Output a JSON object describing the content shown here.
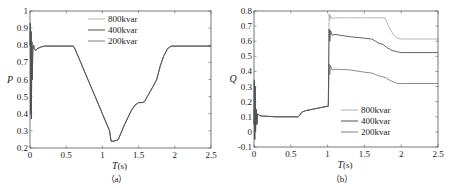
{
  "chart_data": [
    {
      "id": "a",
      "type": "line",
      "caption": "（a）",
      "title": "",
      "xlabel": "T",
      "xunit": "(s)",
      "ylabel": "P",
      "xlim": [
        0,
        2.5
      ],
      "ylim": [
        0.2,
        1.0
      ],
      "xticks": [
        0,
        0.5,
        1,
        1.5,
        2,
        2.5
      ],
      "xtick_labels": [
        "0",
        "0.5",
        "1",
        "1.5",
        "2",
        "2.5"
      ],
      "yticks": [
        0.2,
        0.3,
        0.4,
        0.5,
        0.6,
        0.7,
        0.8,
        0.9,
        1.0
      ],
      "ytick_labels": [
        "0.2",
        "0.3",
        "0.4",
        "0.5",
        "0.6",
        "0.7",
        "0.8",
        "0.9",
        "1"
      ],
      "grid": false,
      "legend_position": "top-center",
      "series": [
        {
          "name": "800kvar",
          "color": "#b0b0b0",
          "x": [
            0,
            0.005,
            0.01,
            0.015,
            0.02,
            0.025,
            0.03,
            0.04,
            0.05,
            0.06,
            0.08,
            0.1,
            0.15,
            0.2,
            0.25,
            0.3,
            0.6,
            0.62,
            0.7,
            0.8,
            0.9,
            1.0,
            1.1,
            1.12,
            1.15,
            1.2,
            1.22,
            1.3,
            1.4,
            1.45,
            1.5,
            1.55,
            1.58,
            1.62,
            1.7,
            1.75,
            1.8,
            1.85,
            1.9,
            1.95,
            2.0,
            2.5
          ],
          "y": [
            0.8,
            0.93,
            0.4,
            0.88,
            0.37,
            0.82,
            0.6,
            0.79,
            0.8,
            0.78,
            0.77,
            0.78,
            0.79,
            0.795,
            0.795,
            0.795,
            0.795,
            0.78,
            0.7,
            0.6,
            0.5,
            0.4,
            0.3,
            0.24,
            0.24,
            0.245,
            0.25,
            0.33,
            0.42,
            0.45,
            0.465,
            0.465,
            0.47,
            0.5,
            0.56,
            0.6,
            0.68,
            0.74,
            0.78,
            0.795,
            0.795,
            0.795
          ]
        },
        {
          "name": "400kvar",
          "color": "#505050",
          "x": [
            0,
            0.005,
            0.01,
            0.015,
            0.02,
            0.025,
            0.03,
            0.04,
            0.05,
            0.06,
            0.08,
            0.1,
            0.15,
            0.2,
            0.25,
            0.3,
            0.6,
            0.62,
            0.7,
            0.8,
            0.9,
            1.0,
            1.1,
            1.12,
            1.15,
            1.2,
            1.22,
            1.3,
            1.4,
            1.45,
            1.5,
            1.55,
            1.58,
            1.62,
            1.7,
            1.75,
            1.8,
            1.85,
            1.9,
            1.95,
            2.0,
            2.5
          ],
          "y": [
            0.8,
            0.93,
            0.4,
            0.88,
            0.37,
            0.82,
            0.6,
            0.79,
            0.8,
            0.78,
            0.77,
            0.78,
            0.79,
            0.795,
            0.795,
            0.795,
            0.795,
            0.78,
            0.7,
            0.6,
            0.5,
            0.4,
            0.3,
            0.24,
            0.24,
            0.245,
            0.25,
            0.33,
            0.42,
            0.45,
            0.465,
            0.465,
            0.47,
            0.5,
            0.56,
            0.6,
            0.68,
            0.74,
            0.78,
            0.795,
            0.795,
            0.795
          ]
        },
        {
          "name": "200kvar",
          "color": "#808080",
          "x": [
            0,
            0.005,
            0.01,
            0.015,
            0.02,
            0.025,
            0.03,
            0.04,
            0.05,
            0.06,
            0.08,
            0.1,
            0.15,
            0.2,
            0.25,
            0.3,
            0.6,
            0.62,
            0.7,
            0.8,
            0.9,
            1.0,
            1.1,
            1.12,
            1.15,
            1.2,
            1.22,
            1.3,
            1.4,
            1.45,
            1.5,
            1.55,
            1.58,
            1.62,
            1.7,
            1.75,
            1.8,
            1.85,
            1.9,
            1.95,
            2.0,
            2.5
          ],
          "y": [
            0.8,
            0.93,
            0.4,
            0.88,
            0.37,
            0.82,
            0.6,
            0.79,
            0.8,
            0.78,
            0.77,
            0.78,
            0.79,
            0.795,
            0.795,
            0.795,
            0.795,
            0.78,
            0.7,
            0.6,
            0.5,
            0.4,
            0.3,
            0.24,
            0.24,
            0.245,
            0.25,
            0.33,
            0.42,
            0.45,
            0.465,
            0.465,
            0.47,
            0.5,
            0.56,
            0.6,
            0.68,
            0.74,
            0.78,
            0.795,
            0.795,
            0.795
          ]
        }
      ]
    },
    {
      "id": "b",
      "type": "line",
      "caption": "（b）",
      "title": "",
      "xlabel": "T",
      "xunit": "(s)",
      "ylabel": "Q",
      "xlim": [
        0,
        2.5
      ],
      "ylim": [
        -0.1,
        0.8
      ],
      "xticks": [
        0,
        0.5,
        1,
        1.5,
        2,
        2.5
      ],
      "xtick_labels": [
        "0",
        "0.5",
        "1",
        "1.5",
        "2",
        "2.5"
      ],
      "yticks": [
        -0.1,
        0,
        0.1,
        0.2,
        0.3,
        0.4,
        0.5,
        0.6,
        0.7,
        0.8
      ],
      "ytick_labels": [
        "-0.1",
        "0",
        "0.1",
        "0.2",
        "0.3",
        "0.4",
        "0.5",
        "0.6",
        "0.7",
        "0.8"
      ],
      "grid": false,
      "legend_position": "bottom-right",
      "series": [
        {
          "name": "800kvar",
          "color": "#b0b0b0",
          "x": [
            0,
            0.005,
            0.01,
            0.015,
            0.02,
            0.03,
            0.04,
            0.05,
            0.07,
            0.1,
            0.3,
            0.6,
            0.62,
            0.65,
            0.7,
            0.8,
            0.9,
            1.0,
            1.01,
            1.02,
            1.03,
            1.04,
            1.06,
            1.1,
            1.3,
            1.5,
            1.7,
            1.78,
            1.8,
            1.85,
            1.9,
            1.95,
            2.0,
            2.5
          ],
          "y": [
            0.05,
            0.34,
            -0.05,
            0.3,
            0.0,
            0.15,
            0.05,
            0.12,
            0.11,
            0.105,
            0.1,
            0.1,
            0.11,
            0.13,
            0.14,
            0.15,
            0.16,
            0.17,
            0.17,
            0.78,
            0.74,
            0.77,
            0.75,
            0.755,
            0.755,
            0.755,
            0.755,
            0.755,
            0.73,
            0.68,
            0.64,
            0.62,
            0.615,
            0.615
          ]
        },
        {
          "name": "400kvar",
          "color": "#505050",
          "x": [
            0,
            0.005,
            0.01,
            0.015,
            0.02,
            0.03,
            0.04,
            0.05,
            0.07,
            0.1,
            0.3,
            0.6,
            0.62,
            0.65,
            0.7,
            0.8,
            0.9,
            1.0,
            1.01,
            1.02,
            1.03,
            1.04,
            1.06,
            1.1,
            1.3,
            1.5,
            1.6,
            1.65,
            1.7,
            1.75,
            1.8,
            1.85,
            1.9,
            1.95,
            2.0,
            2.5
          ],
          "y": [
            0.05,
            0.34,
            -0.05,
            0.3,
            0.0,
            0.15,
            0.05,
            0.12,
            0.11,
            0.105,
            0.1,
            0.1,
            0.11,
            0.13,
            0.14,
            0.15,
            0.16,
            0.17,
            0.17,
            0.68,
            0.6,
            0.67,
            0.64,
            0.645,
            0.63,
            0.62,
            0.615,
            0.6,
            0.585,
            0.58,
            0.56,
            0.545,
            0.535,
            0.53,
            0.525,
            0.525
          ]
        },
        {
          "name": "200kvar",
          "color": "#808080",
          "x": [
            0,
            0.005,
            0.01,
            0.015,
            0.02,
            0.03,
            0.04,
            0.05,
            0.07,
            0.1,
            0.3,
            0.6,
            0.62,
            0.65,
            0.7,
            0.8,
            0.9,
            1.0,
            1.01,
            1.02,
            1.03,
            1.04,
            1.06,
            1.1,
            1.3,
            1.5,
            1.6,
            1.65,
            1.7,
            1.75,
            1.8,
            1.85,
            1.9,
            1.95,
            2.0,
            2.5
          ],
          "y": [
            0.05,
            0.34,
            -0.05,
            0.3,
            0.0,
            0.15,
            0.05,
            0.12,
            0.11,
            0.105,
            0.1,
            0.1,
            0.11,
            0.13,
            0.14,
            0.15,
            0.16,
            0.17,
            0.17,
            0.45,
            0.38,
            0.44,
            0.41,
            0.415,
            0.41,
            0.395,
            0.39,
            0.38,
            0.37,
            0.365,
            0.355,
            0.34,
            0.33,
            0.32,
            0.32,
            0.32
          ]
        }
      ]
    }
  ]
}
